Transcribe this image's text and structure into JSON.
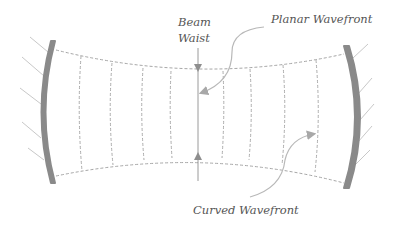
{
  "diagram": {
    "labels": {
      "beam_waist_line1": "Beam",
      "beam_waist_line2": "Waist",
      "planar_wavefront": "Planar Wavefront",
      "curved_wavefront": "Curved Wavefront"
    },
    "colors": {
      "mirror": "#8a8a8a",
      "hatch": "#c8c8c8",
      "dashed": "#a6a6a6",
      "axis": "#9a9a9a",
      "callout": "#b8b8b8",
      "text": "#555555"
    },
    "components": [
      "left-concave-mirror",
      "right-concave-mirror",
      "beam-envelope",
      "wavefronts",
      "waist-marker"
    ]
  }
}
